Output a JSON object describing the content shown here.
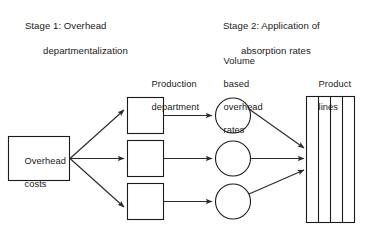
{
  "diagram": {
    "type": "flow",
    "title_stage1_line1": "Stage 1: Overhead",
    "title_stage1_line2": "departmentalization",
    "title_stage2_line1": "Stage 2: Application of",
    "title_stage2_line2": "absorption rates",
    "labels": {
      "overhead_costs_line1": "Overhead",
      "overhead_costs_line2": "costs",
      "production_department_line1": "Production",
      "production_department_line2": "department",
      "volume_rates_line1": "Volume",
      "volume_rates_line2": "based",
      "volume_rates_line3": "overhead",
      "volume_rates_line4": "rates",
      "product_lines_line1": "Product",
      "product_lines_line2": "lines"
    },
    "counts": {
      "production_departments": 3,
      "overhead_rate_circles": 3,
      "product_line_columns": 4
    },
    "colors": {
      "stroke": "#1a1a1a",
      "arrow": "#2b2b2b",
      "fill": "#ffffff",
      "background": "#ffffff"
    }
  }
}
